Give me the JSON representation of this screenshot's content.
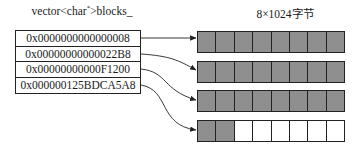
{
  "vector": {
    "label_prefix": "vector<char",
    "label_star": "*",
    "label_suffix": ">blocks_",
    "entries": [
      "0x0000000000000008",
      "0x00000000000022B8",
      "0x00000000000F1200",
      "0x000000125BDCA5A8"
    ]
  },
  "blocks": {
    "label": "8×1024字节",
    "cells_per_block": 8,
    "rows": [
      {
        "filled": 8
      },
      {
        "filled": 8
      },
      {
        "filled": 8
      },
      {
        "filled": 2
      }
    ],
    "fill_color": "#8f8f8f",
    "empty_color": "#ffffff"
  }
}
